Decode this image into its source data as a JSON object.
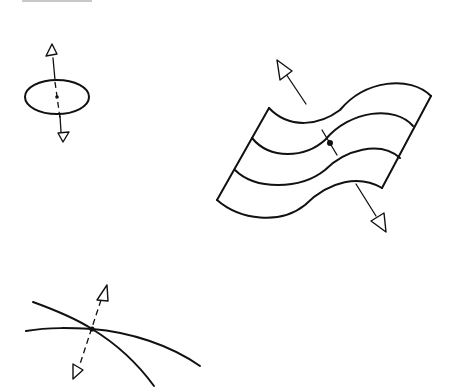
{
  "diagram": {
    "background": "#ffffff",
    "stroke_color": "#111111",
    "figures": [
      {
        "id": "disk",
        "description": "Oriented elliptical disk with center point and two opposite normal arrows (dashed through the disk)",
        "center": [
          57,
          97
        ],
        "arrows": [
          "up",
          "down"
        ]
      },
      {
        "id": "wavy-surface",
        "description": "Wavy surface patch with three sinusoidal grid lines, marked point, and two opposite normal arrows",
        "point": [
          330,
          143
        ],
        "arrows": [
          "up-left",
          "down-right"
        ]
      },
      {
        "id": "intersecting-curves",
        "description": "Two curves crossing at a point with a dashed normal line and two opposite arrow heads",
        "point": [
          92,
          329
        ],
        "arrows": [
          "up",
          "down"
        ]
      }
    ]
  }
}
